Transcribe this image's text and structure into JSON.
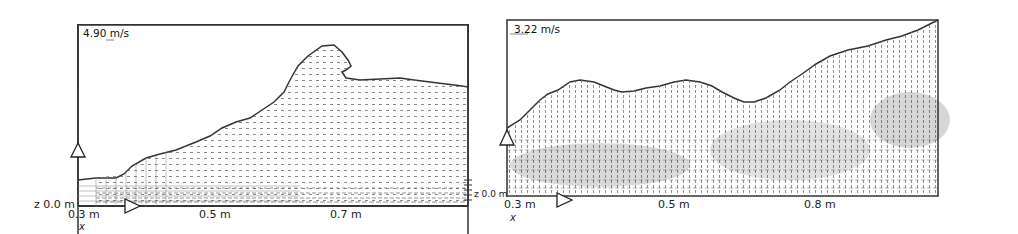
{
  "figure": {
    "panels": [
      {
        "id": "left",
        "scale_label": "4.90 m/s",
        "z_label": "z 0.0 m",
        "z_label_right": "z 0.0 m",
        "x_axis_var": "x",
        "x_ticks": [
          "0.3 m",
          "0.5 m",
          "0.7 m"
        ],
        "markers": [
          "still-water-level-triangle",
          "wave-direction-triangle"
        ]
      },
      {
        "id": "right",
        "scale_label": "3.22 m/s",
        "x_axis_var": "x",
        "x_ticks": [
          "0.3 m",
          "0.5 m",
          "0.8 m"
        ],
        "markers": [
          "still-water-level-triangle",
          "wave-direction-triangle"
        ]
      }
    ]
  }
}
